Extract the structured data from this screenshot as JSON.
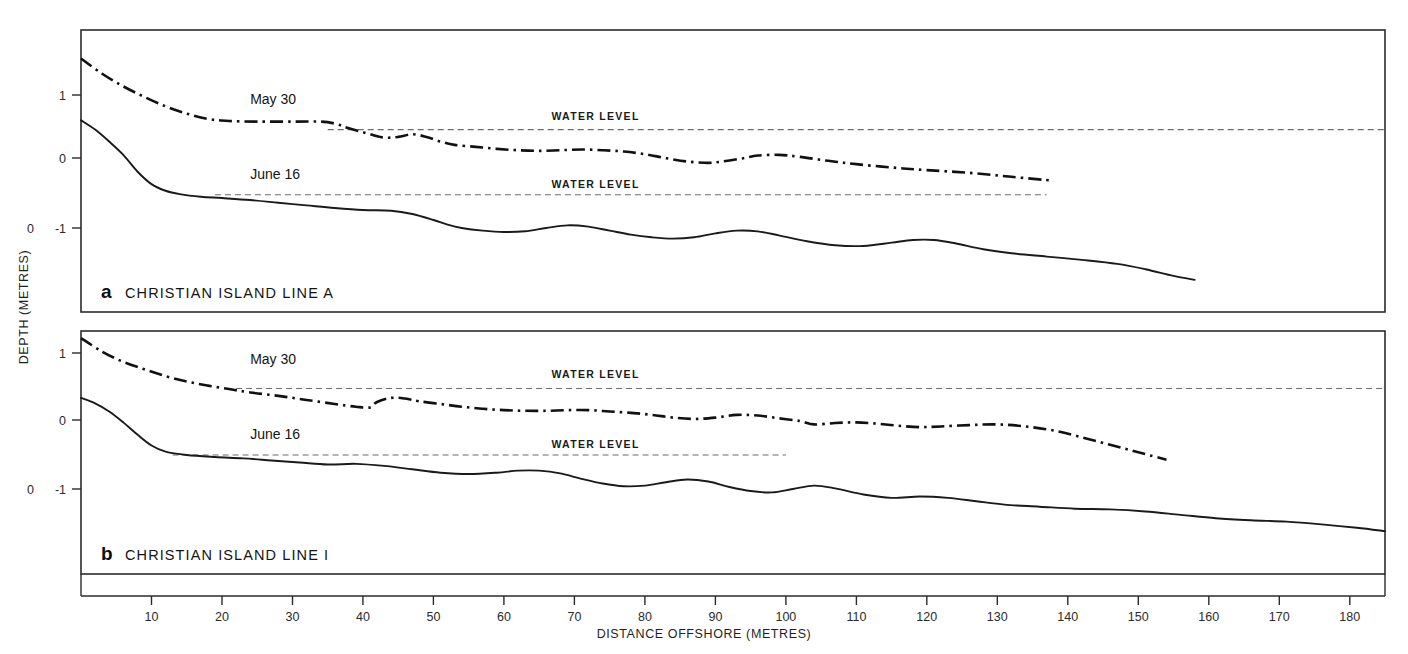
{
  "figure": {
    "xlabel": "DISTANCE OFFSHORE (METRES)",
    "ylabel": "DEPTH (METRES)",
    "background_color": "#ffffff",
    "line_color": "#1a1a1a",
    "waterline_color": "#6d6d6d"
  },
  "chart_data": [
    {
      "type": "line",
      "panel": "a",
      "panel_letter": "a",
      "title": "CHRISTIAN ISLAND   LINE A",
      "xlabel": "DISTANCE OFFSHORE (METRES)",
      "ylabel": "DEPTH (METRES)",
      "xlim": [
        0,
        185
      ],
      "ylim": [
        -1.85,
        1.75
      ],
      "xticks": [
        10,
        20,
        30,
        40,
        50,
        60,
        70,
        80,
        90,
        100,
        110,
        120,
        130,
        140,
        150,
        160,
        170,
        180
      ],
      "yticks": [
        1,
        0,
        -1
      ],
      "ytick_labels": [
        "1",
        "0",
        "-1"
      ],
      "extra_ytick_label": "0",
      "grid": false,
      "legend": "inline-annotations",
      "annotations": [
        {
          "text": "May 30",
          "x": 24,
          "y": 0.86
        },
        {
          "text": "June 16",
          "x": 24,
          "y": -0.27
        },
        {
          "text": "WATER LEVEL",
          "x": 73,
          "y": 0.62
        },
        {
          "text": "WATER LEVEL",
          "x": 73,
          "y": -0.4
        }
      ],
      "waterlines": [
        {
          "name": "May 30 water level",
          "level": 0.48,
          "x_start": 35,
          "x_end": 185,
          "style": "dashed"
        },
        {
          "name": "June 16 water level",
          "level": -0.5,
          "x_start": 19,
          "x_end": 137,
          "style": "dashed"
        }
      ],
      "series": [
        {
          "name": "May 30",
          "style": "dash-dot",
          "x": [
            0,
            3,
            6,
            9,
            12,
            15,
            18,
            21,
            25,
            30,
            34,
            36,
            38,
            41,
            43,
            45,
            47,
            49,
            51,
            53,
            56,
            59,
            62,
            65,
            68,
            71,
            74,
            77,
            80,
            83,
            86,
            89,
            91,
            94,
            96,
            99,
            102,
            106,
            110,
            115,
            120,
            126,
            132,
            138
          ],
          "y": [
            1.55,
            1.32,
            1.13,
            0.97,
            0.83,
            0.72,
            0.64,
            0.61,
            0.6,
            0.6,
            0.6,
            0.57,
            0.5,
            0.41,
            0.36,
            0.37,
            0.41,
            0.37,
            0.3,
            0.25,
            0.22,
            0.19,
            0.17,
            0.16,
            0.17,
            0.18,
            0.17,
            0.15,
            0.11,
            0.05,
            0.0,
            -0.02,
            0.0,
            0.05,
            0.09,
            0.1,
            0.07,
            0.01,
            -0.04,
            -0.09,
            -0.13,
            -0.17,
            -0.23,
            -0.29
          ]
        },
        {
          "name": "June 16",
          "style": "solid",
          "x": [
            0,
            2,
            4,
            6,
            8,
            10,
            12,
            14,
            17,
            20,
            24,
            28,
            32,
            36,
            40,
            44,
            47,
            50,
            52,
            54,
            57,
            60,
            63,
            66,
            69,
            72,
            75,
            78,
            81,
            84,
            87,
            90,
            93,
            96,
            99,
            103,
            107,
            111,
            115,
            118,
            121,
            124,
            128,
            132,
            137,
            142,
            147,
            151,
            155,
            158
          ],
          "y": [
            0.62,
            0.48,
            0.3,
            0.1,
            -0.15,
            -0.34,
            -0.44,
            -0.49,
            -0.53,
            -0.55,
            -0.58,
            -0.62,
            -0.66,
            -0.7,
            -0.73,
            -0.74,
            -0.79,
            -0.88,
            -0.95,
            -1.0,
            -1.04,
            -1.06,
            -1.05,
            -1.0,
            -0.96,
            -0.98,
            -1.04,
            -1.1,
            -1.14,
            -1.16,
            -1.14,
            -1.08,
            -1.04,
            -1.05,
            -1.11,
            -1.2,
            -1.26,
            -1.27,
            -1.22,
            -1.18,
            -1.18,
            -1.23,
            -1.32,
            -1.38,
            -1.43,
            -1.48,
            -1.54,
            -1.62,
            -1.72,
            -1.78
          ]
        }
      ]
    },
    {
      "type": "line",
      "panel": "b",
      "panel_letter": "b",
      "title": "CHRISTIAN ISLAND   LINE I",
      "xlabel": "DISTANCE OFFSHORE (METRES)",
      "ylabel": "DEPTH (METRES)",
      "xlim": [
        0,
        185
      ],
      "ylim": [
        -1.85,
        1.45
      ],
      "xticks": [
        10,
        20,
        30,
        40,
        50,
        60,
        70,
        80,
        90,
        100,
        110,
        120,
        130,
        140,
        150,
        160,
        170,
        180
      ],
      "yticks": [
        1,
        0,
        -1
      ],
      "ytick_labels": [
        "1",
        "0",
        "-1"
      ],
      "extra_ytick_label": "0",
      "grid": false,
      "legend": "inline-annotations",
      "annotations": [
        {
          "text": "May 30",
          "x": 24,
          "y": 0.84
        },
        {
          "text": "June 16",
          "x": 24,
          "y": -0.27
        },
        {
          "text": "WATER LEVEL",
          "x": 73,
          "y": 0.63
        },
        {
          "text": "WATER LEVEL",
          "x": 73,
          "y": -0.39
        }
      ],
      "waterlines": [
        {
          "name": "May 30 water level",
          "level": 0.48,
          "x_start": 22,
          "x_end": 185,
          "style": "dashed"
        },
        {
          "name": "June 16 water level",
          "level": -0.5,
          "x_start": 13,
          "x_end": 100,
          "style": "dashed"
        }
      ],
      "series": [
        {
          "name": "May 30",
          "style": "dash-dot",
          "x": [
            0,
            3,
            6,
            9,
            12,
            15,
            18,
            21,
            24,
            28,
            32,
            36,
            39,
            41,
            42,
            44,
            46,
            48,
            51,
            54,
            57,
            60,
            63,
            66,
            69,
            72,
            75,
            78,
            81,
            84,
            87,
            90,
            93,
            96,
            99,
            102,
            104,
            107,
            110,
            113,
            116,
            119,
            122,
            126,
            130,
            134,
            138,
            142,
            146,
            150,
            154
          ],
          "y": [
            1.22,
            1.02,
            0.87,
            0.76,
            0.66,
            0.58,
            0.52,
            0.47,
            0.42,
            0.37,
            0.31,
            0.25,
            0.21,
            0.2,
            0.28,
            0.34,
            0.33,
            0.29,
            0.25,
            0.21,
            0.18,
            0.16,
            0.15,
            0.15,
            0.16,
            0.16,
            0.14,
            0.12,
            0.09,
            0.05,
            0.03,
            0.05,
            0.09,
            0.08,
            0.04,
            0.0,
            -0.05,
            -0.03,
            -0.02,
            -0.04,
            -0.07,
            -0.09,
            -0.08,
            -0.06,
            -0.05,
            -0.08,
            -0.14,
            -0.24,
            -0.35,
            -0.46,
            -0.57
          ]
        },
        {
          "name": "June 16",
          "style": "solid",
          "x": [
            0,
            2,
            4,
            6,
            8,
            10,
            12,
            15,
            19,
            23,
            27,
            31,
            35,
            39,
            43,
            47,
            51,
            55,
            59,
            62,
            65,
            68,
            71,
            74,
            77,
            80,
            83,
            86,
            89,
            92,
            95,
            98,
            101,
            104,
            107,
            111,
            115,
            119,
            123,
            127,
            131,
            136,
            141,
            146,
            151,
            156,
            161,
            166,
            171,
            176,
            181,
            185
          ],
          "y": [
            0.34,
            0.26,
            0.14,
            -0.02,
            -0.2,
            -0.36,
            -0.45,
            -0.5,
            -0.53,
            -0.55,
            -0.58,
            -0.61,
            -0.64,
            -0.63,
            -0.66,
            -0.71,
            -0.76,
            -0.78,
            -0.76,
            -0.73,
            -0.73,
            -0.77,
            -0.85,
            -0.92,
            -0.96,
            -0.95,
            -0.9,
            -0.86,
            -0.89,
            -0.97,
            -1.03,
            -1.05,
            -1.0,
            -0.95,
            -0.99,
            -1.08,
            -1.13,
            -1.11,
            -1.13,
            -1.18,
            -1.23,
            -1.26,
            -1.29,
            -1.3,
            -1.33,
            -1.38,
            -1.43,
            -1.46,
            -1.48,
            -1.52,
            -1.57,
            -1.62
          ]
        }
      ]
    }
  ]
}
